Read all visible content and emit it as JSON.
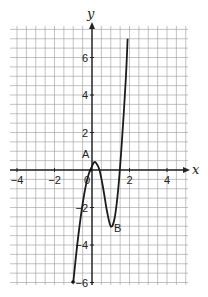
{
  "chart_data": {
    "type": "line",
    "title": "",
    "xlabel": "x",
    "ylabel": "y",
    "xlim": [
      -4.4,
      5.1
    ],
    "ylim": [
      -6.1,
      7.8
    ],
    "grid": true,
    "grid_step": 0.5,
    "x_ticks": [
      -4,
      -2,
      2,
      4
    ],
    "x_tick_labels": [
      "−4",
      "−2",
      "2",
      "4"
    ],
    "y_ticks": [
      -6,
      -4,
      -2,
      2,
      4,
      6
    ],
    "y_tick_labels": [
      "−6",
      "−4",
      "−2",
      "2",
      "4",
      "6"
    ],
    "origin_label": "0",
    "series": [
      {
        "name": "curve",
        "x": [
          -1.0,
          -0.8,
          -0.6,
          -0.4,
          -0.2,
          0.0,
          0.1,
          0.2,
          0.4,
          0.6,
          0.8,
          1.0,
          1.2,
          1.4,
          1.6,
          1.8,
          1.9
        ],
        "y": [
          -6.0,
          -4.1,
          -2.5,
          -1.2,
          -0.3,
          0.2,
          0.4,
          0.4,
          0.0,
          -1.0,
          -2.2,
          -3.0,
          -2.6,
          -1.0,
          1.6,
          4.8,
          7.0
        ]
      }
    ],
    "annotations": [
      {
        "label": "A",
        "x": 0.15,
        "y": 0.5,
        "note": "local maximum"
      },
      {
        "label": "B",
        "x": 1.0,
        "y": -3.0,
        "note": "local minimum"
      }
    ]
  },
  "labels": {
    "x_axis": "x",
    "y_axis": "y",
    "origin": "0",
    "point_a": "A",
    "point_b": "B"
  }
}
